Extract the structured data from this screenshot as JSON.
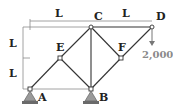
{
  "diagram": {
    "type": "truss",
    "nodes": {
      "A": {
        "label": "A",
        "x": 30,
        "y": 89
      },
      "B": {
        "label": "B",
        "x": 91,
        "y": 89
      },
      "C": {
        "label": "C",
        "x": 91,
        "y": 27
      },
      "D": {
        "label": "D",
        "x": 152,
        "y": 27
      },
      "E": {
        "label": "E",
        "x": 60,
        "y": 58
      },
      "F": {
        "label": "F",
        "x": 121,
        "y": 58
      }
    },
    "members": [
      [
        "A",
        "E"
      ],
      [
        "E",
        "C"
      ],
      [
        "C",
        "D"
      ],
      [
        "C",
        "B"
      ],
      [
        "B",
        "E"
      ],
      [
        "B",
        "F"
      ],
      [
        "F",
        "C"
      ],
      [
        "F",
        "D"
      ]
    ],
    "supports": [
      "A",
      "B"
    ],
    "dimensions": {
      "horizontal": [
        "L",
        "L"
      ],
      "vertical": [
        "L",
        "L"
      ]
    },
    "load": {
      "node": "D",
      "value": "2,000",
      "direction": "down"
    },
    "colors": {
      "member": "#333333",
      "dimension": "#777777",
      "load": "#8a8a8a"
    }
  }
}
